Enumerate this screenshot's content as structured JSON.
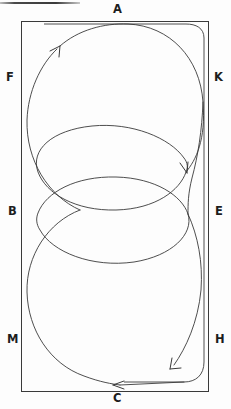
{
  "figure": {
    "title_rule": "",
    "stroke_color": "#2b2b2b",
    "background_color": "#fdfdfd",
    "rect": {
      "x": 21,
      "y": 21,
      "width": 188,
      "height": 371
    },
    "labels": [
      {
        "key": "A",
        "text": "A",
        "x": 113,
        "y": 4,
        "position": "top-center"
      },
      {
        "key": "F",
        "text": "F",
        "x": 6,
        "y": 72,
        "position": "left-upper"
      },
      {
        "key": "K",
        "text": "K",
        "x": 214,
        "y": 72,
        "position": "right-upper"
      },
      {
        "key": "B",
        "text": "B",
        "x": 8,
        "y": 206,
        "position": "left-middle"
      },
      {
        "key": "E",
        "text": "E",
        "x": 215,
        "y": 206,
        "position": "right-middle"
      },
      {
        "key": "M",
        "text": "M",
        "x": 7,
        "y": 334,
        "position": "left-lower"
      },
      {
        "key": "H",
        "text": "H",
        "x": 215,
        "y": 334,
        "position": "right-lower"
      },
      {
        "key": "C",
        "text": "C",
        "x": 113,
        "y": 393,
        "position": "bottom-center"
      }
    ],
    "arrows": [
      {
        "name": "arrow-upper-left",
        "x": 58,
        "y": 47,
        "direction": "up-right"
      },
      {
        "name": "arrow-mid-right",
        "x": 186,
        "y": 151,
        "direction": "down-right"
      },
      {
        "name": "arrow-lower-right",
        "x": 172,
        "y": 368,
        "direction": "down-left"
      },
      {
        "name": "arrow-bottom",
        "x": 118,
        "y": 386,
        "direction": "left"
      }
    ],
    "loops": [
      {
        "name": "loop-upper",
        "cx": 115,
        "cy": 122,
        "rx": 89,
        "ry": 93
      },
      {
        "name": "loop-middle",
        "cx": 115,
        "cy": 190,
        "rx": 82,
        "ry": 65
      },
      {
        "name": "loop-lower",
        "cx": 115,
        "cy": 260,
        "rx": 82,
        "ry": 65
      },
      {
        "name": "loop-bottom",
        "cx": 115,
        "cy": 290,
        "rx": 89,
        "ry": 100
      }
    ]
  }
}
